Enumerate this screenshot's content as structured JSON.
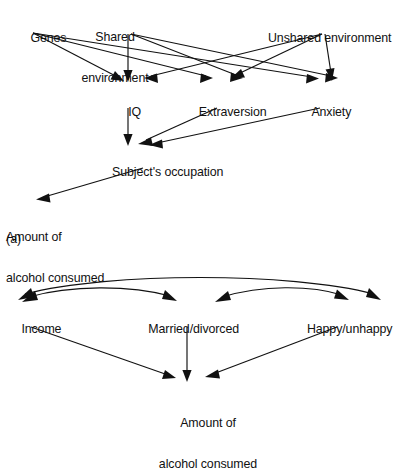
{
  "figure": {
    "type": "diagram",
    "subtype": "path-diagram",
    "background_color": "#ffffff",
    "stroke_color": "#111111",
    "panels": [
      {
        "tag": "(a)",
        "tag_label": "(a)",
        "nodes": [
          {
            "id": "genes",
            "label": "Genes",
            "x": 32,
            "y": 27,
            "align": "left"
          },
          {
            "id": "shared_env",
            "label": "Shared\nenvironment",
            "line1": "Shared",
            "line2": "environment",
            "x": 115,
            "y": 13,
            "align": "center"
          },
          {
            "id": "unshared_env",
            "label": "Unshared environment",
            "x": 323,
            "y": 27,
            "align": "center"
          },
          {
            "id": "iq",
            "label": "IQ",
            "x": 128,
            "y": 95,
            "align": "center"
          },
          {
            "id": "extraversion",
            "label": "Extraversion",
            "x": 226,
            "y": 95,
            "align": "center"
          },
          {
            "id": "anxiety",
            "label": "Anxiety",
            "x": 325,
            "y": 95,
            "align": "center"
          },
          {
            "id": "occupation",
            "label": "Subject's occupation",
            "x": 160,
            "y": 155,
            "align": "center"
          },
          {
            "id": "alcohol_a",
            "label": "Amount of\nalcohol consumed",
            "line1": "Amount of",
            "line2": "alcohol consumed",
            "x": 6,
            "y": 209,
            "align": "left"
          }
        ],
        "edges": [
          {
            "from": "genes",
            "to": "iq",
            "style": "straight",
            "arrow": "single"
          },
          {
            "from": "genes",
            "to": "extraversion",
            "style": "straight",
            "arrow": "single"
          },
          {
            "from": "genes",
            "to": "anxiety",
            "style": "straight",
            "arrow": "single"
          },
          {
            "from": "shared_env",
            "to": "iq",
            "style": "straight",
            "arrow": "single"
          },
          {
            "from": "shared_env",
            "to": "extraversion",
            "style": "straight",
            "arrow": "single"
          },
          {
            "from": "shared_env",
            "to": "anxiety",
            "style": "straight",
            "arrow": "single"
          },
          {
            "from": "unshared_env",
            "to": "iq",
            "style": "straight",
            "arrow": "single"
          },
          {
            "from": "unshared_env",
            "to": "extraversion",
            "style": "straight",
            "arrow": "single"
          },
          {
            "from": "unshared_env",
            "to": "anxiety",
            "style": "straight",
            "arrow": "single"
          },
          {
            "from": "iq",
            "to": "occupation",
            "style": "straight",
            "arrow": "single"
          },
          {
            "from": "extraversion",
            "to": "occupation",
            "style": "straight",
            "arrow": "single"
          },
          {
            "from": "anxiety",
            "to": "occupation",
            "style": "straight",
            "arrow": "single"
          },
          {
            "from": "occupation",
            "to": "alcohol_a",
            "style": "straight",
            "arrow": "single"
          }
        ]
      },
      {
        "tag": "(b)",
        "tag_label": "",
        "nodes": [
          {
            "id": "income",
            "label": "Income",
            "x": 8,
            "y": 312,
            "align": "left"
          },
          {
            "id": "married",
            "label": "Married/divorced",
            "x": 187,
            "y": 312,
            "align": "center"
          },
          {
            "id": "happy",
            "label": "Happy/unhappy",
            "x": 342,
            "y": 312,
            "align": "center"
          },
          {
            "id": "alcohol_b",
            "label": "Amount of\nalcohol consumed",
            "line1": "Amount of",
            "line2": "alcohol consumed",
            "x": 208,
            "y": 396,
            "align": "center"
          }
        ],
        "edges": [
          {
            "from": "income",
            "to": "married",
            "style": "curved",
            "arrow": "double"
          },
          {
            "from": "married",
            "to": "happy",
            "style": "curved",
            "arrow": "double"
          },
          {
            "from": "income",
            "to": "happy",
            "style": "curved",
            "arrow": "double"
          },
          {
            "from": "income",
            "to": "alcohol_b",
            "style": "straight",
            "arrow": "single"
          },
          {
            "from": "married",
            "to": "alcohol_b",
            "style": "straight",
            "arrow": "single"
          },
          {
            "from": "happy",
            "to": "alcohol_b",
            "style": "straight",
            "arrow": "single"
          }
        ]
      }
    ]
  }
}
